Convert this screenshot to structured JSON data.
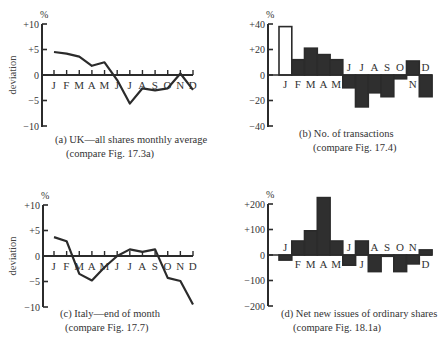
{
  "chart_data": [
    {
      "id": "a",
      "type": "line",
      "title": "(a)  UK—all shares monthly average",
      "subtitle": "(compare Fig. 17.3a)",
      "ylabel": "deviation",
      "yunit": "%",
      "ylim": [
        -10,
        10
      ],
      "yticks": [
        "+10",
        "+5",
        "0",
        "−5",
        "−10"
      ],
      "ytick_values": [
        10,
        5,
        0,
        -5,
        -10
      ],
      "categories": [
        "J",
        "F",
        "M",
        "A",
        "M",
        "J",
        "J",
        "A",
        "S",
        "O",
        "N",
        "D"
      ],
      "values": [
        4.5,
        4.2,
        3.6,
        1.8,
        2.5,
        -1.0,
        -5.6,
        -2.6,
        -3.0,
        -2.6,
        0.3,
        -2.9
      ],
      "grid": false
    },
    {
      "id": "b",
      "type": "bar",
      "title": "(b) No. of transactions",
      "subtitle": "(compare Fig. 17.4)",
      "ylabel": "",
      "yunit": "%",
      "ylim": [
        -40,
        40
      ],
      "yticks": [
        "+40",
        "+20",
        "0",
        "−20",
        "−40"
      ],
      "ytick_values": [
        40,
        20,
        0,
        -20,
        -40
      ],
      "categories": [
        "J",
        "F",
        "M",
        "A",
        "M",
        "J",
        "J",
        "A",
        "S",
        "O",
        "N",
        "D"
      ],
      "values": [
        38,
        12,
        21,
        16,
        12,
        -10,
        -25,
        -14,
        -17,
        -3,
        11,
        -17
      ],
      "bar_fill": [
        "open",
        "filled",
        "filled",
        "filled",
        "filled",
        "filled",
        "filled",
        "filled",
        "filled",
        "filled",
        "filled",
        "filled"
      ],
      "grid": false
    },
    {
      "id": "c",
      "type": "line",
      "title": "(c)  Italy—end of month",
      "subtitle": "(compare Fig. 17.7)",
      "ylabel": "deviation",
      "yunit": "%",
      "ylim": [
        -10,
        10
      ],
      "yticks": [
        "+10",
        "+5",
        "0",
        "−5",
        "−10"
      ],
      "ytick_values": [
        10,
        5,
        0,
        -5,
        -10
      ],
      "categories": [
        "J",
        "F",
        "M",
        "A",
        "M",
        "J",
        "J",
        "A",
        "S",
        "O",
        "N",
        "D"
      ],
      "values": [
        3.7,
        2.9,
        -3.5,
        -4.8,
        -2.2,
        0.0,
        1.3,
        0.8,
        1.3,
        -4.3,
        -4.9,
        -9.5
      ],
      "grid": false
    },
    {
      "id": "d",
      "type": "bar",
      "title": "(d)  Net new issues of ordinary shares",
      "subtitle": "(compare Fig. 18.1a)",
      "ylabel": "",
      "yunit": "%",
      "ylim": [
        -200,
        200
      ],
      "yticks": [
        "+200",
        "+100",
        "0",
        "−100",
        "−200"
      ],
      "ytick_values": [
        200,
        100,
        0,
        -100,
        -200
      ],
      "categories": [
        "J",
        "F",
        "M",
        "A",
        "M",
        "J",
        "J",
        "A",
        "S",
        "O",
        "N",
        "D"
      ],
      "values": [
        -20,
        55,
        95,
        225,
        55,
        -40,
        55,
        -65,
        -5,
        -65,
        -35,
        20
      ],
      "grid": false
    }
  ],
  "labels": {
    "a": {
      "title": "(a)  UK—all shares monthly average",
      "subtitle": "(compare Fig. 17.3a)",
      "ylabel": "deviation",
      "unit": "%"
    },
    "b": {
      "title": "(b) No. of transactions",
      "subtitle": "(compare Fig. 17.4)",
      "unit": "%"
    },
    "c": {
      "title": "(c)  Italy—end of month",
      "subtitle": "(compare Fig. 17.7)",
      "ylabel": "deviation",
      "unit": "%"
    },
    "d": {
      "title": "(d)  Net new issues of ordinary shares",
      "subtitle": "(compare Fig. 18.1a)",
      "unit": "%"
    }
  }
}
